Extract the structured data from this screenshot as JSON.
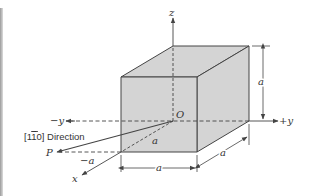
{
  "diagram": {
    "type": "cubic unit cell with crystallographic direction",
    "colors": {
      "face_fill": "#d4d4d4",
      "line": "#444444",
      "background": "#ffffff"
    },
    "axes": {
      "z_label": "z",
      "pos_y_label": "+y",
      "neg_y_label": "−y",
      "x_label": "x"
    },
    "points": {
      "origin_label": "O",
      "p_label": "P"
    },
    "dimensions": {
      "height_label": "a",
      "width_label": "a",
      "depth_label": "a",
      "diag_label": "a",
      "neg_a_label": "−a"
    },
    "direction": {
      "label_prefix": "[1",
      "label_bar_digit": "1",
      "label_suffix": "0] Direction"
    }
  }
}
